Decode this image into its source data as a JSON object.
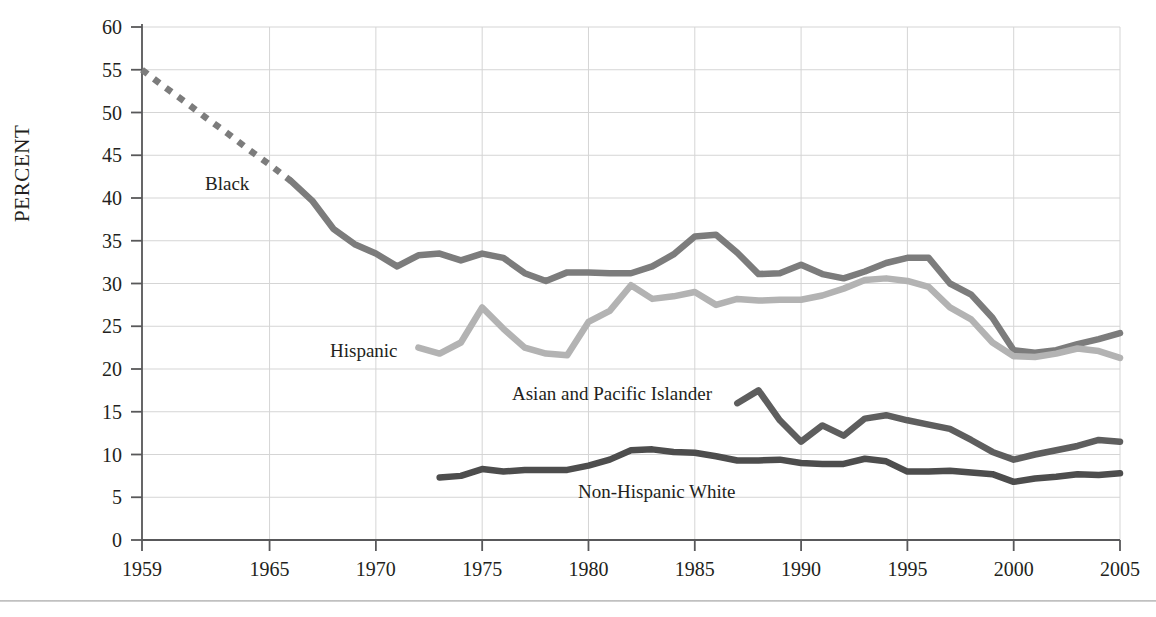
{
  "axis": {
    "ylabel": "PERCENT",
    "y_ticks": [
      "0",
      "5",
      "10",
      "15",
      "20",
      "25",
      "30",
      "35",
      "40",
      "45",
      "50",
      "55",
      "60"
    ],
    "x_ticks": [
      "1959",
      "1965",
      "1970",
      "1975",
      "1980",
      "1985",
      "1990",
      "1995",
      "2000",
      "2005"
    ]
  },
  "labels": {
    "black": "Black",
    "hispanic": "Hispanic",
    "asian": "Asian and Pacific Islander",
    "white": "Non-Hispanic White"
  },
  "colors": {
    "black_series": "#7c7c7c",
    "hispanic_series": "#b3b3b3",
    "asian_series": "#5e5e5e",
    "white_series": "#4d4d4d",
    "grid": "#d5d5d5",
    "axis": "#58585a",
    "text": "#231f20"
  },
  "chart_data": {
    "type": "line",
    "title": "",
    "xlabel": "",
    "ylabel": "PERCENT",
    "xlim": [
      1959,
      2005
    ],
    "ylim": [
      0,
      60
    ],
    "ytick_step": 5,
    "grid": true,
    "legend": "inline-labels",
    "xtick_values": [
      1959,
      1965,
      1970,
      1975,
      1980,
      1985,
      1990,
      1995,
      2000,
      2005
    ],
    "ytick_values": [
      0,
      5,
      10,
      15,
      20,
      25,
      30,
      35,
      40,
      45,
      50,
      55,
      60
    ],
    "series": [
      {
        "name": "Black",
        "color": "#7c7c7c",
        "style_segments": [
          {
            "style": "dashed",
            "from": 1959,
            "to": 1966
          },
          {
            "style": "solid",
            "from": 1966,
            "to": 2005
          }
        ],
        "x": [
          1959,
          1960,
          1961,
          1962,
          1963,
          1964,
          1965,
          1966,
          1967,
          1968,
          1969,
          1970,
          1971,
          1972,
          1973,
          1974,
          1975,
          1976,
          1977,
          1978,
          1979,
          1980,
          1981,
          1982,
          1983,
          1984,
          1985,
          1986,
          1987,
          1988,
          1989,
          1990,
          1991,
          1992,
          1993,
          1994,
          1995,
          1996,
          1997,
          1998,
          1999,
          2000,
          2001,
          2002,
          2003,
          2004,
          2005
        ],
        "y": [
          55.0,
          53.1,
          51.3,
          49.4,
          47.6,
          45.7,
          43.9,
          42.0,
          39.7,
          36.4,
          34.6,
          33.5,
          32.0,
          33.3,
          33.5,
          32.7,
          33.5,
          33.0,
          31.2,
          30.3,
          31.3,
          31.3,
          31.2,
          31.2,
          32.0,
          33.4,
          35.5,
          35.7,
          33.6,
          31.1,
          31.2,
          32.2,
          31.1,
          30.6,
          31.4,
          32.4,
          33.0,
          33.0,
          30.0,
          28.7,
          26.0,
          22.2,
          21.9,
          22.2,
          22.9,
          23.5,
          24.2
        ]
      },
      {
        "name": "Hispanic",
        "color": "#b3b3b3",
        "style_segments": [
          {
            "style": "solid",
            "from": 1972,
            "to": 2005
          }
        ],
        "x": [
          1972,
          1973,
          1974,
          1975,
          1976,
          1977,
          1978,
          1979,
          1980,
          1981,
          1982,
          1983,
          1984,
          1985,
          1986,
          1987,
          1988,
          1989,
          1990,
          1991,
          1992,
          1993,
          1994,
          1995,
          1996,
          1997,
          1998,
          1999,
          2000,
          2001,
          2002,
          2003,
          2004,
          2005
        ],
        "y": [
          22.5,
          21.8,
          23.1,
          27.2,
          24.7,
          22.5,
          21.8,
          21.6,
          25.5,
          26.8,
          29.8,
          28.2,
          28.5,
          29.0,
          27.5,
          28.2,
          28.0,
          28.1,
          28.1,
          28.6,
          29.4,
          30.4,
          30.6,
          30.3,
          29.6,
          27.2,
          25.8,
          23.1,
          21.5,
          21.4,
          21.8,
          22.4,
          22.1,
          21.3
        ]
      },
      {
        "name": "Asian and Pacific Islander",
        "color": "#5e5e5e",
        "style_segments": [
          {
            "style": "solid",
            "from": 1987,
            "to": 2005
          }
        ],
        "x": [
          1987,
          1988,
          1989,
          1990,
          1991,
          1992,
          1993,
          1994,
          1995,
          1996,
          1997,
          1998,
          1999,
          2000,
          2001,
          2002,
          2003,
          2004,
          2005
        ],
        "y": [
          16.0,
          17.5,
          14.0,
          11.5,
          13.4,
          12.2,
          14.2,
          14.6,
          14.0,
          13.5,
          13.0,
          11.7,
          10.3,
          9.4,
          10.0,
          10.5,
          11.0,
          11.7,
          11.5
        ]
      },
      {
        "name": "Non-Hispanic White",
        "color": "#4d4d4d",
        "style_segments": [
          {
            "style": "solid",
            "from": 1973,
            "to": 2005
          }
        ],
        "x": [
          1973,
          1974,
          1975,
          1976,
          1977,
          1978,
          1979,
          1980,
          1981,
          1982,
          1983,
          1984,
          1985,
          1986,
          1987,
          1988,
          1989,
          1990,
          1991,
          1992,
          1993,
          1994,
          1995,
          1996,
          1997,
          1998,
          1999,
          2000,
          2001,
          2002,
          2003,
          2004,
          2005
        ],
        "y": [
          7.3,
          7.5,
          8.3,
          8.0,
          8.2,
          8.2,
          8.2,
          8.7,
          9.4,
          10.5,
          10.6,
          10.3,
          10.2,
          9.8,
          9.3,
          9.3,
          9.4,
          9.0,
          8.9,
          8.9,
          9.5,
          9.2,
          8.0,
          8.0,
          8.1,
          7.9,
          7.7,
          6.8,
          7.2,
          7.4,
          7.7,
          7.6,
          7.8
        ]
      }
    ]
  }
}
